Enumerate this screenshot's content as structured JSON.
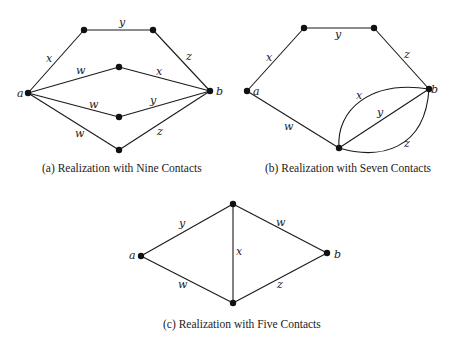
{
  "figures": [
    {
      "id": "a",
      "caption": "(a) Realization with Nine Contacts",
      "terminals": {
        "a": "a",
        "b": "b"
      },
      "edges": [
        {
          "from": "a",
          "to": "p1",
          "label": "x"
        },
        {
          "from": "p1",
          "to": "p2",
          "label": "y"
        },
        {
          "from": "p2",
          "to": "b",
          "label": "z"
        },
        {
          "from": "a",
          "to": "p3",
          "label": "w"
        },
        {
          "from": "p3",
          "to": "b",
          "label": "x"
        },
        {
          "from": "a",
          "to": "p4",
          "label": "w"
        },
        {
          "from": "p4",
          "to": "b",
          "label": "y"
        },
        {
          "from": "a",
          "to": "p5",
          "label": "w"
        },
        {
          "from": "p5",
          "to": "b",
          "label": "z"
        }
      ]
    },
    {
      "id": "b",
      "caption": "(b) Realization with Seven Contacts",
      "terminals": {
        "a": "a",
        "b": "b"
      },
      "edges": [
        {
          "from": "a",
          "to": "p1",
          "label": "x"
        },
        {
          "from": "p1",
          "to": "p2",
          "label": "y"
        },
        {
          "from": "p2",
          "to": "b",
          "label": "z"
        },
        {
          "from": "a",
          "to": "p3",
          "label": "w"
        },
        {
          "from": "p3",
          "to": "b",
          "label": "x",
          "shape": "arc-upper"
        },
        {
          "from": "p3",
          "to": "b",
          "label": "y",
          "shape": "straight"
        },
        {
          "from": "p3",
          "to": "b",
          "label": "z",
          "shape": "arc-lower"
        }
      ]
    },
    {
      "id": "c",
      "caption": "(c) Realization with Five Contacts",
      "terminals": {
        "a": "a",
        "b": "b"
      },
      "edges": [
        {
          "from": "a",
          "to": "top",
          "label": "y"
        },
        {
          "from": "top",
          "to": "b",
          "label": "w"
        },
        {
          "from": "top",
          "to": "bottom",
          "label": "x"
        },
        {
          "from": "a",
          "to": "bottom",
          "label": "w"
        },
        {
          "from": "bottom",
          "to": "b",
          "label": "z"
        }
      ]
    }
  ]
}
